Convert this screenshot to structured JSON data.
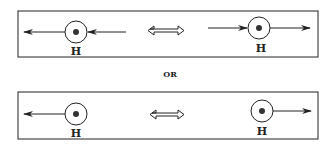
{
  "diagram": {
    "panels": [
      {
        "id": "top",
        "left_particle": {
          "label": "H",
          "arrows": [
            "outgoing-left",
            "incoming-from-right"
          ]
        },
        "relation": "double-headed-arrow",
        "right_particle": {
          "label": "H",
          "arrows": [
            "incoming-from-left",
            "outgoing-right"
          ]
        }
      },
      {
        "id": "bottom",
        "left_particle": {
          "label": "H",
          "arrows": [
            "outgoing-left"
          ]
        },
        "relation": "double-headed-arrow",
        "right_particle": {
          "label": "H",
          "arrows": [
            "outgoing-right"
          ]
        }
      }
    ],
    "separator_text": "OR",
    "colors": {
      "stroke": "#222222",
      "background": "#ffffff"
    }
  }
}
